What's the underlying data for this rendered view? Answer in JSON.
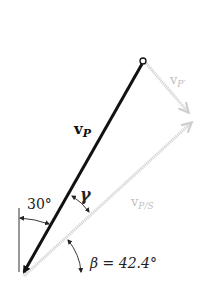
{
  "diagram": {
    "type": "velocity-vector-diagram",
    "vectors": [
      {
        "name": "v_P",
        "label_main": "v",
        "label_sub": "P",
        "color": "#111111",
        "style": "solid"
      },
      {
        "name": "v_P'",
        "label_main": "v",
        "label_sub": "P′",
        "color": "#c8c8c8",
        "style": "hatched"
      },
      {
        "name": "v_P/S",
        "label_main": "v",
        "label_sub": "P/S",
        "color": "#c8c8c8",
        "style": "hatched"
      }
    ],
    "angles": {
      "alpha": {
        "label": "30°"
      },
      "gamma": {
        "label": "γ"
      },
      "beta": {
        "label": "β = 42.4°"
      }
    }
  }
}
